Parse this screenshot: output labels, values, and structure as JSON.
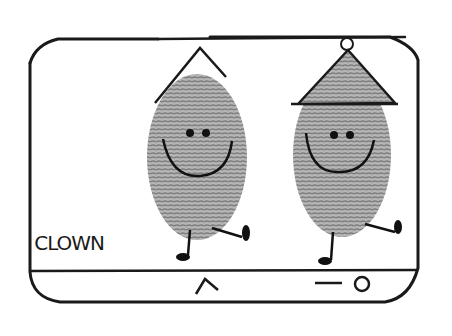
{
  "sketch": {
    "caption": "CLOWN",
    "figures": [
      {
        "name": "left-clown",
        "hat": "pointed-hat",
        "face": "smiley"
      },
      {
        "name": "right-clown",
        "hat": "triangle-hat-with-pompom",
        "face": "smiley"
      }
    ],
    "bottom_bar": {
      "icons": [
        "caret-up-icon",
        "arrow-circle-icon"
      ]
    },
    "colors": {
      "ink": "#1a1a1a",
      "fingerprint": "#9a9a9a",
      "background": "#ffffff"
    }
  }
}
